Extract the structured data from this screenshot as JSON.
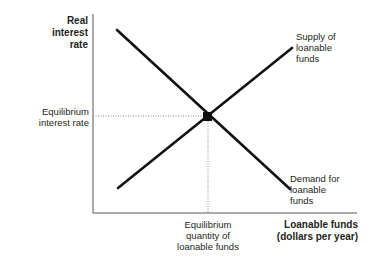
{
  "diagram": {
    "type": "supply-demand",
    "y_axis_label": "Real interest rate",
    "x_axis_label_line1": "Loanable funds",
    "x_axis_label_line2": "(dollars per year)",
    "supply_curve": {
      "label_line1": "Supply of",
      "label_line2": "loanable",
      "label_line3": "funds",
      "slope": "upward"
    },
    "demand_curve": {
      "label_line1": "Demand for",
      "label_line2": "loanable",
      "label_line3": "funds",
      "slope": "downward"
    },
    "equilibrium": {
      "rate_label_line1": "Equilibrium",
      "rate_label_line2": "interest rate",
      "quantity_label_line1": "Equilibrium",
      "quantity_label_line2": "quantity of",
      "quantity_label_line3": "loanable funds"
    },
    "colors": {
      "line": "#111111",
      "axis": "#555555",
      "dotted": "#888888",
      "text": "#231f20"
    }
  }
}
